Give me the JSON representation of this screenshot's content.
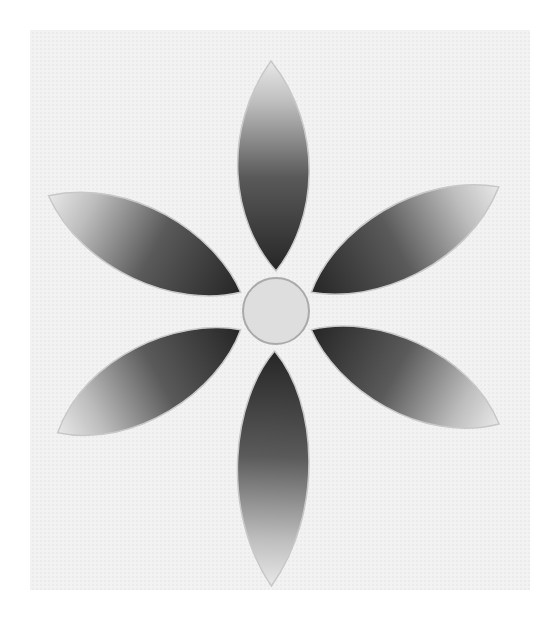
{
  "image": {
    "subject": "embroidered six-petal flower",
    "palette": {
      "fabric": "#f1f1f1",
      "petal_dark": "#2e2e2e",
      "petal_light": "#e6e6e6",
      "center": "#dcdcdc",
      "outline": "#bdbdbd"
    }
  }
}
